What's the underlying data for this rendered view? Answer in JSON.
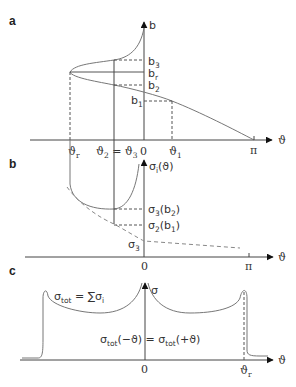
{
  "panels": {
    "a": {
      "label": "a",
      "y_axis": "b",
      "x_axis": "ϑ",
      "y_ticks": {
        "b3": "b",
        "b3_sub": "3",
        "br": "b",
        "br_sub": "r",
        "b2": "b",
        "b2_sub": "2",
        "b1": "b",
        "b1_sub": "1"
      },
      "x_ticks": {
        "theta_r": "ϑ",
        "theta_r_sub": "r",
        "theta23": "ϑ",
        "theta23_sub1": "2",
        "theta23_eq": " = ϑ",
        "theta23_sub2": "3",
        "zero": "0",
        "theta1": "ϑ",
        "theta1_sub": "1",
        "pi": "π"
      }
    },
    "b": {
      "label": "b",
      "y_axis": "σ",
      "y_axis_sub": "i",
      "y_axis_arg": "(ϑ)",
      "x_axis": "ϑ",
      "labels": {
        "s3b2": "σ",
        "s3b2_sub": "3",
        "s3b2_arg": "(b",
        "s3b2_argsub": "2",
        "s3b2_close": ")",
        "s2b1": "σ",
        "s2b1_sub": "2",
        "s2b1_arg": "(b",
        "s2b1_argsub": "1",
        "s2b1_close": ")",
        "s3": "σ",
        "s3_sub": "3"
      },
      "x_ticks": {
        "zero": "0",
        "pi": "π"
      }
    },
    "c": {
      "label": "c",
      "y_axis": "σ",
      "x_axis": "ϑ",
      "formula_sum": {
        "sigma": "σ",
        "sub": "tot",
        "rest": " = ∑σ",
        "rest_sub": "i"
      },
      "formula_sym": {
        "left": "σ",
        "left_sub": "tot",
        "left_arg": "(−ϑ) = σ",
        "right_sub": "tot",
        "right_arg": "(+ϑ)"
      },
      "x_ticks": {
        "zero": "0",
        "theta_r": "ϑ",
        "theta_r_sub": "r"
      }
    }
  }
}
